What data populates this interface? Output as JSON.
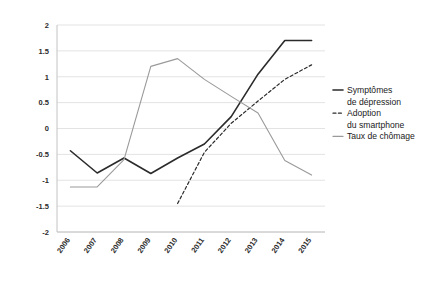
{
  "chart_data": {
    "type": "line",
    "title": "",
    "subtitle": "",
    "xlabel": "",
    "ylabel": "",
    "x": [
      "2006",
      "2007",
      "2008",
      "2009",
      "2010",
      "2011",
      "2012",
      "2013",
      "2014",
      "2015"
    ],
    "categories": [
      "2006",
      "2007",
      "2008",
      "2009",
      "2010",
      "2011",
      "2012",
      "2013",
      "2014",
      "2015"
    ],
    "ylim": [
      -2,
      2
    ],
    "yticks": [
      2,
      1.5,
      1,
      0.5,
      0,
      -0.5,
      -1,
      -1.5,
      -2
    ],
    "ytick_labels": [
      "2",
      "1.5",
      "1",
      "0.5",
      "0",
      "-0.5",
      "-1",
      "-1.5",
      "-2"
    ],
    "grid": true,
    "grid_axis": "y",
    "legend_position": "right",
    "series": [
      {
        "name": "Symptômes de dépression",
        "legend_label_line1": "Symptômes",
        "legend_label_line2": "de dépression",
        "style": "solid",
        "color": "#2b2b2b",
        "width": 1.6,
        "values": [
          -0.43,
          -0.86,
          -0.57,
          -0.87,
          -0.57,
          -0.3,
          0.23,
          1.05,
          1.7,
          1.7
        ]
      },
      {
        "name": "Adoption du smartphone",
        "legend_label_line1": "Adoption",
        "legend_label_line2": "du smartphone",
        "style": "dashed",
        "color": "#2b2b2b",
        "width": 1.2,
        "values": [
          null,
          null,
          null,
          null,
          -1.45,
          -0.46,
          0.1,
          0.53,
          0.95,
          1.23
        ]
      },
      {
        "name": "Taux de chômage",
        "legend_label_line1": "Taux de chômage",
        "legend_label_line2": "",
        "style": "solid",
        "color": "#9a9a9a",
        "width": 1.1,
        "values": [
          -1.13,
          -1.13,
          -0.6,
          1.2,
          1.35,
          0.95,
          0.62,
          0.3,
          -0.62,
          -0.9
        ]
      }
    ]
  },
  "axes": {
    "y_axis_name": "value-axis",
    "x_axis_name": "year-axis"
  }
}
